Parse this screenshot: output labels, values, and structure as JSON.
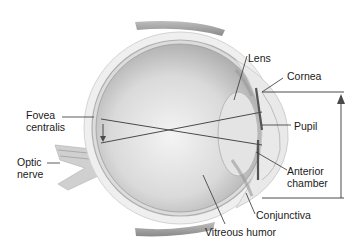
{
  "diagram": {
    "labels": {
      "lens": "Lens",
      "cornea": "Cornea",
      "fovea_line1": "Fovea",
      "fovea_line2": "centralis",
      "pupil": "Pupil",
      "optic_line1": "Optic",
      "optic_line2": "nerve",
      "anterior_line1": "Anterior",
      "anterior_line2": "chamber",
      "conjunctiva": "Conjunctiva",
      "vitreous": "Vitreous humor"
    },
    "colors": {
      "background": "#ffffff",
      "sclera": "#e8e8e8",
      "interior": "#cfcfcf",
      "leader_line": "#333333",
      "ray_line": "#4a4a4a"
    }
  }
}
